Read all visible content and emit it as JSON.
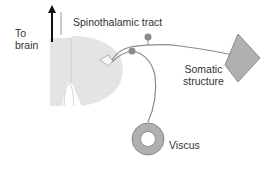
{
  "diagram": {
    "labels": {
      "to_brain": [
        "To",
        "brain"
      ],
      "tract": "Spinothalamic tract",
      "somatic": [
        "Somatic",
        "structure"
      ],
      "viscus": "Viscus"
    },
    "colors": {
      "fill": "#e4e4e4",
      "outline": "#b8b8b8",
      "nerve": "#8a8a8a",
      "ganglion": "#8c8c8c",
      "organ_fill": "#b0b0b0",
      "organ_stroke": "#7a7a7a",
      "arrow": "#111111",
      "text": "#333333"
    }
  }
}
